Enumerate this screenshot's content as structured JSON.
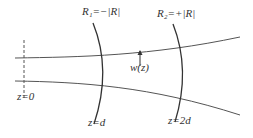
{
  "diagram": {
    "labels": {
      "r1": "R₁=−|R|",
      "r2": "R₂=+|R|",
      "waist_width": "w(z)",
      "z0": "z=0",
      "zd": "z=d",
      "z2d": "z=2d"
    },
    "colors": {
      "line": "#555555",
      "mirror": "#333333",
      "text": "#333333"
    }
  }
}
